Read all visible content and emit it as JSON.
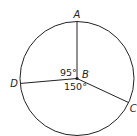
{
  "diagram": {
    "type": "circle-with-central-angles",
    "center_label": "B",
    "points": [
      {
        "label": "A",
        "position": "top"
      },
      {
        "label": "C",
        "position": "lower-right"
      },
      {
        "label": "D",
        "position": "left"
      }
    ],
    "angles": [
      {
        "between": [
          "D",
          "A"
        ],
        "label": "95°",
        "degrees": 95
      },
      {
        "between": [
          "D",
          "C"
        ],
        "label": "150°",
        "degrees": 150
      }
    ],
    "colors": {
      "stroke": "#222222",
      "background": "#ffffff"
    }
  }
}
